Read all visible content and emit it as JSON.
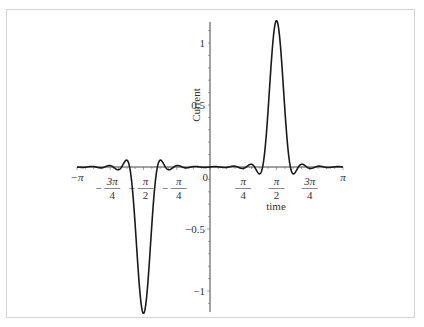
{
  "chart_data": {
    "type": "line",
    "title": "",
    "xlabel": "time",
    "ylabel": "Current",
    "xlim": [
      -3.14159,
      3.14159
    ],
    "ylim": [
      -1.17,
      1.17
    ],
    "grid": false,
    "legend": null,
    "x_ticks": [
      {
        "value": -3.14159,
        "label": "-π",
        "kind": "plain"
      },
      {
        "value": -2.35619,
        "label": "-3π/4",
        "num": "3π",
        "den": "4",
        "sign": "-",
        "kind": "frac"
      },
      {
        "value": -1.5708,
        "label": "-π/2",
        "num": "π",
        "den": "2",
        "sign": "-",
        "kind": "frac"
      },
      {
        "value": -0.7854,
        "label": "-π/4",
        "num": "π",
        "den": "4",
        "sign": "-",
        "kind": "frac"
      },
      {
        "value": 0,
        "label": "0",
        "kind": "plain"
      },
      {
        "value": 0.7854,
        "label": "π/4",
        "num": "π",
        "den": "4",
        "sign": "",
        "kind": "frac"
      },
      {
        "value": 1.5708,
        "label": "π/2",
        "num": "π",
        "den": "2",
        "sign": "",
        "kind": "frac"
      },
      {
        "value": 2.35619,
        "label": "3π/4",
        "num": "3π",
        "den": "4",
        "sign": "",
        "kind": "frac"
      },
      {
        "value": 3.14159,
        "label": "π",
        "kind": "plain"
      }
    ],
    "y_ticks": [
      {
        "value": 1,
        "label": "1"
      },
      {
        "value": 0.5,
        "label": "0.5"
      },
      {
        "value": -0.5,
        "label": "-0.5"
      },
      {
        "value": -1,
        "label": "-1"
      }
    ],
    "series": [
      {
        "name": "Current",
        "description": "Fourier sine-series approximation of an odd pulse train: +1 pulse centered at π/2, -1 pulse centered at -π/2, with Gibbs ringing",
        "model": {
          "pulse_center": 1.5708,
          "half_width": 0.2,
          "harmonics": 15
        },
        "key_points": [
          {
            "x": -3.14159,
            "y": 0
          },
          {
            "x": -1.75,
            "y": 0.07
          },
          {
            "x": -1.62,
            "y": -1.1
          },
          {
            "x": -1.5708,
            "y": -0.9
          },
          {
            "x": -1.52,
            "y": -1.1
          },
          {
            "x": -1.39,
            "y": 0.07
          },
          {
            "x": 0,
            "y": 0
          },
          {
            "x": 1.39,
            "y": -0.07
          },
          {
            "x": 1.52,
            "y": 1.1
          },
          {
            "x": 1.5708,
            "y": 0.9
          },
          {
            "x": 1.62,
            "y": 1.1
          },
          {
            "x": 1.75,
            "y": -0.07
          },
          {
            "x": 3.14159,
            "y": 0
          }
        ],
        "color": "#1a1a1a"
      }
    ]
  }
}
